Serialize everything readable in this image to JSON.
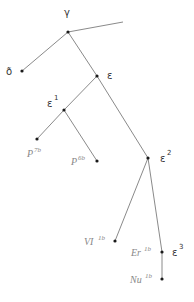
{
  "diagram": {
    "type": "tree",
    "nodes": {
      "gamma": {
        "label": "γ",
        "x": 68,
        "y": 32
      },
      "delta": {
        "label": "ð",
        "x": 22,
        "y": 71
      },
      "epsilon": {
        "label": "ε",
        "x": 97,
        "y": 76
      },
      "epsilon1": {
        "label": "ε",
        "sup": "1",
        "x": 64,
        "y": 110
      },
      "p7b": {
        "label": "P",
        "sup": "7b",
        "x": 37,
        "y": 139
      },
      "p6b": {
        "label": "P",
        "sup": "6b",
        "x": 97,
        "y": 161
      },
      "epsilon2": {
        "label": "ε",
        "sup": "2",
        "x": 148,
        "y": 158
      },
      "vi1b": {
        "label": "VI",
        "sup": "1b",
        "x": 115,
        "y": 241
      },
      "er1b": {
        "label": "Er",
        "sup": "1b",
        "x": 162,
        "y": 252
      },
      "epsilon3": {
        "label": "ε",
        "sup": "3"
      },
      "nu1b": {
        "label": "Nu",
        "sup": "1b",
        "x": 162,
        "y": 279
      }
    },
    "edges": [
      [
        "gamma",
        "delta"
      ],
      [
        "gamma",
        "epsilon"
      ],
      [
        "gamma",
        "open-right"
      ],
      [
        "epsilon",
        "epsilon1"
      ],
      [
        "epsilon",
        "epsilon2"
      ],
      [
        "epsilon1",
        "p7b"
      ],
      [
        "epsilon1",
        "p6b"
      ],
      [
        "epsilon2",
        "vi1b"
      ],
      [
        "epsilon2",
        "er1b"
      ],
      [
        "er1b",
        "nu1b"
      ]
    ],
    "colors": {
      "edge": "#8a8a8a",
      "node": "#1a1a1a",
      "greek_label": "#333333",
      "leaf_label": "#888888"
    }
  }
}
